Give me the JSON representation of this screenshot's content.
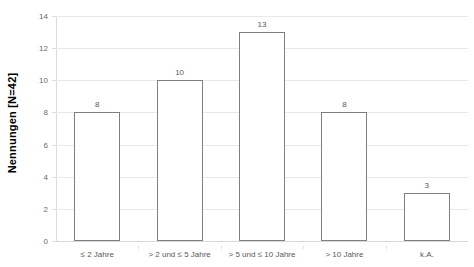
{
  "chart_data": {
    "type": "bar",
    "title": "",
    "xlabel": "",
    "ylabel": "Nennungen [N=42]",
    "categories": [
      "≤ 2 Jahre",
      "> 2 und ≤ 5 Jahre",
      "> 5 und ≤ 10 Jahre",
      "> 10 Jahre",
      "k.A."
    ],
    "values": [
      8,
      10,
      13,
      8,
      3
    ],
    "data_labels": [
      "8",
      "10",
      "13",
      "8",
      "3"
    ],
    "ylim": [
      0,
      14
    ],
    "ytick_labels": [
      "0",
      "2",
      "4",
      "6",
      "8",
      "10",
      "12",
      "14"
    ],
    "ytick_values": [
      0,
      2,
      4,
      6,
      8,
      10,
      12,
      14
    ],
    "grid": true,
    "legend": "none",
    "bar_fill_color": "#ffffff",
    "bar_border_color": "#7f7f7f",
    "gridline_color": "#e8e8e8",
    "tick_label_color": "#6a6a6a",
    "axis_title_color": "#000000"
  }
}
